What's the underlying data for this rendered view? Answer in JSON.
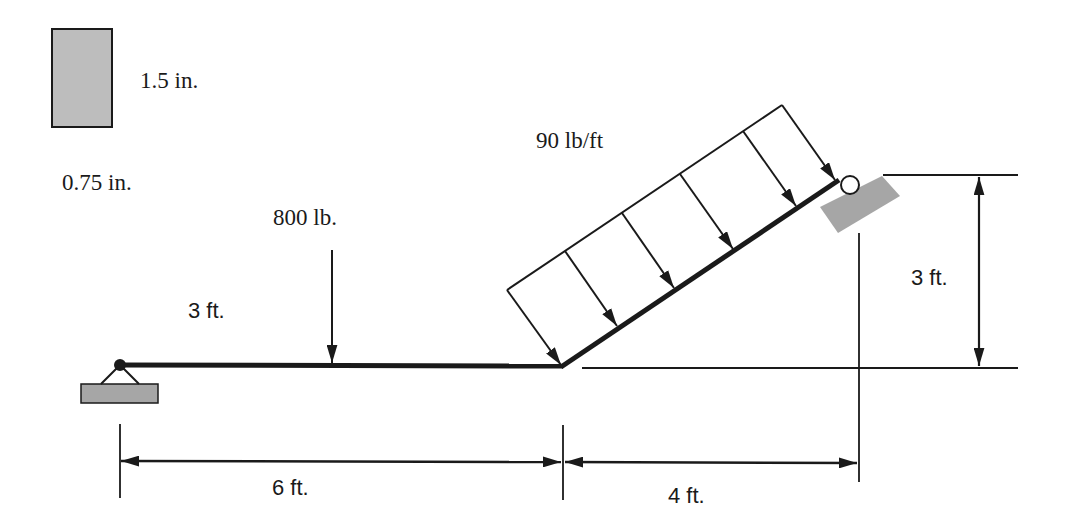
{
  "diagram": {
    "type": "structural-beam-free-body",
    "colors": {
      "line": "#1a1a1a",
      "support_fill": "#a6a6a6",
      "section_fill": "#bdbdbd",
      "background": "#ffffff"
    },
    "cross_section": {
      "height_label": "1.5 in.",
      "width_label": "0.75 in."
    },
    "loads": {
      "point_load_label": "800 lb.",
      "point_load_position_label": "3 ft.",
      "distributed_load_label": "90 lb/ft"
    },
    "dimensions": {
      "horizontal_span_label": "6 ft.",
      "inclined_horizontal_run_label": "4 ft.",
      "inclined_rise_label": "3 ft."
    },
    "supports": {
      "left": "pin",
      "right": "roller-on-incline"
    }
  }
}
